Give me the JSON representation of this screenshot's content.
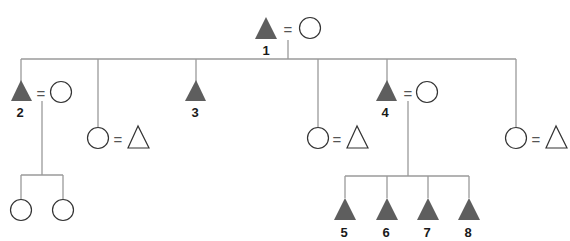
{
  "diagram": {
    "type": "kinship-chart",
    "colors": {
      "line": "#9a9a9a",
      "filled_male": "#5e5e5e",
      "outline": "#333333",
      "label": "#1a1a1a"
    },
    "legend_symbols": {
      "filled-triangle": "male (ego lineage)",
      "circle": "female",
      "open-triangle": "male (in-law)",
      "=": "marriage"
    },
    "nodes": [
      {
        "id": "1",
        "label": "1",
        "shape": "filled-triangle",
        "spouse": "circle"
      },
      {
        "id": "2",
        "label": "2",
        "shape": "filled-triangle",
        "spouse": "circle",
        "parent": "1"
      },
      {
        "id": "d1",
        "label": "",
        "shape": "circle",
        "spouse": "open-triangle",
        "parent": "1"
      },
      {
        "id": "3",
        "label": "3",
        "shape": "filled-triangle",
        "parent": "1"
      },
      {
        "id": "d2",
        "label": "",
        "shape": "circle",
        "spouse": "open-triangle",
        "parent": "1"
      },
      {
        "id": "4",
        "label": "4",
        "shape": "filled-triangle",
        "spouse": "circle",
        "parent": "1"
      },
      {
        "id": "d3",
        "label": "",
        "shape": "circle",
        "spouse": "open-triangle",
        "parent": "1"
      },
      {
        "id": "g2a",
        "label": "",
        "shape": "circle",
        "parent": "2"
      },
      {
        "id": "g2b",
        "label": "",
        "shape": "circle",
        "parent": "2"
      },
      {
        "id": "5",
        "label": "5",
        "shape": "filled-triangle",
        "parent": "4"
      },
      {
        "id": "6",
        "label": "6",
        "shape": "filled-triangle",
        "parent": "4"
      },
      {
        "id": "7",
        "label": "7",
        "shape": "filled-triangle",
        "parent": "4"
      },
      {
        "id": "8",
        "label": "8",
        "shape": "filled-triangle",
        "parent": "4"
      }
    ],
    "labels": {
      "n1": "1",
      "n2": "2",
      "n3": "3",
      "n4": "4",
      "n5": "5",
      "n6": "6",
      "n7": "7",
      "n8": "8"
    },
    "marriage_symbol": "="
  }
}
